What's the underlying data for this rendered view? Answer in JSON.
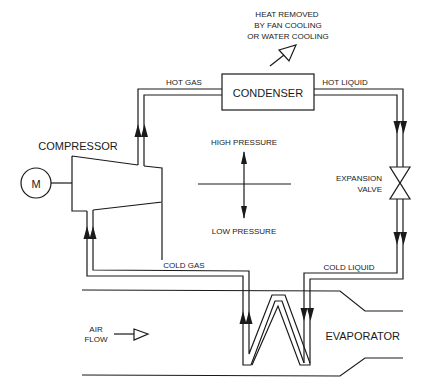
{
  "diagram": {
    "components": {
      "compressor": "COMPRESSOR",
      "motor": "M",
      "condenser": "CONDENSER",
      "expansion_valve_line1": "EXPANSION",
      "expansion_valve_line2": "VALVE",
      "evaporator": "EVAPORATOR"
    },
    "flows": {
      "hot_gas": "HOT GAS",
      "hot_liquid": "HOT LIQUID",
      "cold_liquid": "COLD LIQUID",
      "cold_gas": "COLD GAS"
    },
    "heat_note": [
      "HEAT REMOVED",
      "BY FAN COOLING",
      "OR WATER COOLING"
    ],
    "pressure": {
      "high": "HIGH PRESSURE",
      "low": "LOW PRESSURE"
    },
    "air_flow": [
      "AIR",
      "FLOW"
    ],
    "colors": {
      "line": "#1a1a1a",
      "background": "#ffffff"
    }
  }
}
